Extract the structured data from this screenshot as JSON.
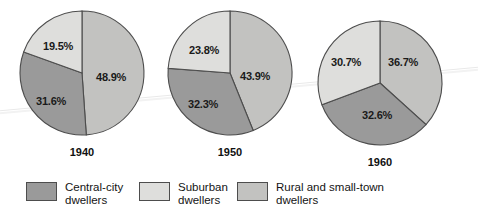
{
  "chart_data": {
    "type": "pie",
    "title": "",
    "subtitle": "",
    "xlabel": "",
    "ylabel": "",
    "legend_position": "bottom",
    "grid": false,
    "categories": [
      "Central-city dwellers",
      "Suburban dwellers",
      "Rural and small-town dwellers"
    ],
    "charts": [
      {
        "name": "1940",
        "labels": [
          "Rural and small-town dwellers",
          "Central-city dwellers",
          "Suburban dwellers"
        ],
        "values": [
          48.9,
          31.6,
          19.5
        ],
        "value_labels": [
          "48.9%",
          "31.6%",
          "19.5%"
        ]
      },
      {
        "name": "1950",
        "labels": [
          "Rural and small-town dwellers",
          "Central-city dwellers",
          "Suburban dwellers"
        ],
        "values": [
          43.9,
          32.3,
          23.8
        ],
        "value_labels": [
          "43.9%",
          "32.3%",
          "23.8%"
        ]
      },
      {
        "name": "1960",
        "labels": [
          "Rural and small-town dwellers",
          "Central-city dwellers",
          "Suburban dwellers"
        ],
        "values": [
          36.7,
          32.6,
          30.7
        ],
        "value_labels": [
          "36.7%",
          "32.6%",
          "30.7%"
        ]
      }
    ],
    "colors": {
      "central_city": "#9a9a9a",
      "suburban": "#dededc",
      "rural_small_town": "#c2c2c0",
      "outline": "#4d4d4d",
      "text": "#1a1a1a",
      "background": "#ffffff"
    }
  },
  "pies": [
    {
      "year": "1940",
      "slices": [
        {
          "name": "rural",
          "label": "48.9%",
          "value": 48.9
        },
        {
          "name": "central-city",
          "label": "31.6%",
          "value": 31.6
        },
        {
          "name": "suburban",
          "label": "19.5%",
          "value": 19.5
        }
      ]
    },
    {
      "year": "1950",
      "slices": [
        {
          "name": "rural",
          "label": "43.9%",
          "value": 43.9
        },
        {
          "name": "central-city",
          "label": "32.3%",
          "value": 32.3
        },
        {
          "name": "suburban",
          "label": "23.8%",
          "value": 23.8
        }
      ]
    },
    {
      "year": "1960",
      "slices": [
        {
          "name": "rural",
          "label": "36.7%",
          "value": 36.7
        },
        {
          "name": "central-city",
          "label": "32.6%",
          "value": 32.6
        },
        {
          "name": "suburban",
          "label": "30.7%",
          "value": 30.7
        }
      ]
    }
  ],
  "legend": {
    "items": [
      {
        "key": "central-city",
        "line1": "Central-city",
        "line2": "dwellers",
        "color": "#9a9a9a"
      },
      {
        "key": "suburban",
        "line1": "Suburban",
        "line2": "dwellers",
        "color": "#dededc"
      },
      {
        "key": "rural-small-town",
        "line1": "Rural and small-town",
        "line2": "dwellers",
        "color": "#c2c2c0"
      }
    ]
  }
}
